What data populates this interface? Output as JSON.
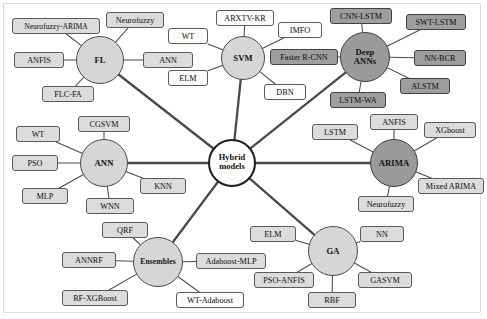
{
  "diagram": {
    "type": "radial-network",
    "colors": {
      "hub_light_fill": "#d6d6d6",
      "hub_dark_fill": "#9a9a9a",
      "hub_center_fill": "#ffffff",
      "leaf_light_fill": "#dcdcdc",
      "leaf_white_fill": "#fdfdfd",
      "leaf_dark_fill": "#9e9e9e",
      "edge_stroke": "#4a4a4a",
      "background": "#ffffff"
    },
    "center": {
      "label_line1": "Hybrid",
      "label_line2": "models",
      "x": 232,
      "y": 163,
      "r": 24
    },
    "hubs": [
      {
        "id": "fl",
        "label": "FL",
        "x": 100,
        "y": 60,
        "r": 24,
        "style": "light"
      },
      {
        "id": "svm",
        "label": "SVM",
        "x": 243,
        "y": 58,
        "r": 22,
        "style": "light"
      },
      {
        "id": "deep_anns",
        "label_line1": "Deep",
        "label_line2": "ANNs",
        "x": 365,
        "y": 57,
        "r": 25,
        "style": "dark"
      },
      {
        "id": "ann",
        "label": "ANN",
        "x": 104,
        "y": 163,
        "r": 24,
        "style": "light"
      },
      {
        "id": "arima",
        "label": "ARIMA",
        "x": 394,
        "y": 163,
        "r": 24,
        "style": "dark"
      },
      {
        "id": "ensembles",
        "label": "Ensembles",
        "x": 158,
        "y": 262,
        "r": 25,
        "style": "light"
      },
      {
        "id": "ga",
        "label": "GA",
        "x": 333,
        "y": 251,
        "r": 25,
        "style": "light"
      }
    ],
    "leaves": [
      {
        "id": "neurofuzzy-arima",
        "label": "Neurofuzzy-ARIMA",
        "hub": "fl",
        "x": 12,
        "y": 18,
        "w": 88,
        "h": 16,
        "style": "light"
      },
      {
        "id": "neurofuzzy-fl",
        "label": "Neurofuzzy",
        "hub": "fl",
        "x": 106,
        "y": 12,
        "w": 58,
        "h": 16,
        "style": "light"
      },
      {
        "id": "anfis-fl",
        "label": "ANFIS",
        "hub": "fl",
        "x": 14,
        "y": 52,
        "w": 50,
        "h": 16,
        "style": "light"
      },
      {
        "id": "ann-fl",
        "label": "ANN",
        "hub": "fl",
        "x": 143,
        "y": 52,
        "w": 50,
        "h": 16,
        "style": "light"
      },
      {
        "id": "flc-fa",
        "label": "FLC-FA",
        "hub": "fl",
        "x": 42,
        "y": 86,
        "w": 52,
        "h": 16,
        "style": "light"
      },
      {
        "id": "arxtv-kr",
        "label": "ARXTV-KR",
        "hub": "svm",
        "x": 216,
        "y": 10,
        "w": 58,
        "h": 16,
        "style": "white"
      },
      {
        "id": "imfo",
        "label": "IMFO",
        "hub": "svm",
        "x": 278,
        "y": 22,
        "w": 44,
        "h": 16,
        "style": "white"
      },
      {
        "id": "wt-svm",
        "label": "WT",
        "hub": "svm",
        "x": 168,
        "y": 28,
        "w": 40,
        "h": 16,
        "style": "white"
      },
      {
        "id": "elm-svm",
        "label": "ELM",
        "hub": "svm",
        "x": 168,
        "y": 70,
        "w": 40,
        "h": 16,
        "style": "white"
      },
      {
        "id": "dbn",
        "label": "DBN",
        "hub": "svm",
        "x": 264,
        "y": 84,
        "w": 42,
        "h": 16,
        "style": "white"
      },
      {
        "id": "cnn-lstm",
        "label": "CNN-LSTM",
        "hub": "deep_anns",
        "x": 330,
        "y": 8,
        "w": 62,
        "h": 16,
        "style": "dark"
      },
      {
        "id": "swt-lstm",
        "label": "SWT-LSTM",
        "hub": "deep_anns",
        "x": 406,
        "y": 14,
        "w": 60,
        "h": 16,
        "style": "dark"
      },
      {
        "id": "faster-rcnn",
        "label": "Faster R-CNN",
        "hub": "deep_anns",
        "x": 270,
        "y": 49,
        "w": 68,
        "h": 16,
        "style": "dark"
      },
      {
        "id": "nn-bcr",
        "label": "NN-BCR",
        "hub": "deep_anns",
        "x": 414,
        "y": 50,
        "w": 52,
        "h": 16,
        "style": "dark"
      },
      {
        "id": "alstm",
        "label": "ALSTM",
        "hub": "deep_anns",
        "x": 400,
        "y": 78,
        "w": 50,
        "h": 16,
        "style": "dark"
      },
      {
        "id": "lstm-wa",
        "label": "LSTM-WA",
        "hub": "deep_anns",
        "x": 330,
        "y": 92,
        "w": 56,
        "h": 16,
        "style": "dark"
      },
      {
        "id": "cgsvm",
        "label": "CGSVM",
        "hub": "ann",
        "x": 78,
        "y": 116,
        "w": 52,
        "h": 16,
        "style": "light"
      },
      {
        "id": "wt-ann",
        "label": "WT",
        "hub": "ann",
        "x": 16,
        "y": 126,
        "w": 44,
        "h": 16,
        "style": "light"
      },
      {
        "id": "pso",
        "label": "PSO",
        "hub": "ann",
        "x": 12,
        "y": 155,
        "w": 46,
        "h": 16,
        "style": "light"
      },
      {
        "id": "mlp",
        "label": "MLP",
        "hub": "ann",
        "x": 22,
        "y": 188,
        "w": 46,
        "h": 16,
        "style": "light"
      },
      {
        "id": "wnn",
        "label": "WNN",
        "hub": "ann",
        "x": 86,
        "y": 198,
        "w": 48,
        "h": 16,
        "style": "light"
      },
      {
        "id": "knn",
        "label": "KNN",
        "hub": "ann",
        "x": 140,
        "y": 178,
        "w": 46,
        "h": 16,
        "style": "light"
      },
      {
        "id": "lstm-arima",
        "label": "LSTM",
        "hub": "arima",
        "x": 312,
        "y": 124,
        "w": 46,
        "h": 16,
        "style": "light"
      },
      {
        "id": "anfis-arima",
        "label": "ANFIS",
        "hub": "arima",
        "x": 370,
        "y": 114,
        "w": 48,
        "h": 16,
        "style": "light"
      },
      {
        "id": "xgboost",
        "label": "XGboost",
        "hub": "arima",
        "x": 424,
        "y": 122,
        "w": 52,
        "h": 16,
        "style": "light"
      },
      {
        "id": "mixed-arima",
        "label": "Mixed ARIMA",
        "hub": "arima",
        "x": 418,
        "y": 178,
        "w": 66,
        "h": 16,
        "style": "light"
      },
      {
        "id": "neurofuzzy-arima2",
        "label": "Neurofuzzy",
        "hub": "arima",
        "x": 358,
        "y": 196,
        "w": 56,
        "h": 16,
        "style": "light"
      },
      {
        "id": "qrf",
        "label": "QRF",
        "hub": "ensembles",
        "x": 102,
        "y": 222,
        "w": 46,
        "h": 16,
        "style": "light"
      },
      {
        "id": "annrf",
        "label": "ANNRF",
        "hub": "ensembles",
        "x": 62,
        "y": 252,
        "w": 54,
        "h": 16,
        "style": "light"
      },
      {
        "id": "rf-xgboost",
        "label": "RF-XGBoost",
        "hub": "ensembles",
        "x": 62,
        "y": 290,
        "w": 66,
        "h": 16,
        "style": "light"
      },
      {
        "id": "wt-adaboost",
        "label": "WT-Adaboost",
        "hub": "ensembles",
        "x": 176,
        "y": 292,
        "w": 68,
        "h": 16,
        "style": "white"
      },
      {
        "id": "adaboost-mlp",
        "label": "Adaboost-MLP",
        "hub": "ensembles",
        "x": 196,
        "y": 253,
        "w": 70,
        "h": 16,
        "style": "light"
      },
      {
        "id": "elm-ga",
        "label": "ELM",
        "hub": "ga",
        "x": 250,
        "y": 226,
        "w": 46,
        "h": 16,
        "style": "light"
      },
      {
        "id": "nn-ga",
        "label": "NN",
        "hub": "ga",
        "x": 360,
        "y": 226,
        "w": 44,
        "h": 16,
        "style": "light"
      },
      {
        "id": "pso-anfis",
        "label": "PSO-ANFIS",
        "hub": "ga",
        "x": 254,
        "y": 272,
        "w": 60,
        "h": 16,
        "style": "light"
      },
      {
        "id": "gasvm",
        "label": "GASVM",
        "hub": "ga",
        "x": 358,
        "y": 272,
        "w": 54,
        "h": 16,
        "style": "light"
      },
      {
        "id": "rbf",
        "label": "RBF",
        "hub": "ga",
        "x": 308,
        "y": 292,
        "w": 48,
        "h": 16,
        "style": "light"
      }
    ],
    "spokes": [
      {
        "from": "center",
        "to": "fl"
      },
      {
        "from": "center",
        "to": "svm"
      },
      {
        "from": "center",
        "to": "deep_anns"
      },
      {
        "from": "center",
        "to": "ann"
      },
      {
        "from": "center",
        "to": "arima"
      },
      {
        "from": "center",
        "to": "ensembles"
      },
      {
        "from": "center",
        "to": "ga"
      }
    ]
  }
}
